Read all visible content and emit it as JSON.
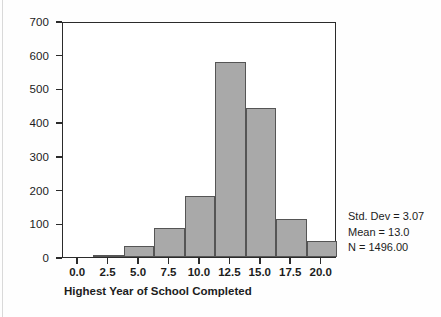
{
  "chart_data": {
    "type": "bar",
    "title": "",
    "subtitle": "",
    "xlabel": "Highest Year of School Completed",
    "ylabel": "",
    "xlim": [
      -1.25,
      21.25
    ],
    "ylim": [
      0,
      700
    ],
    "bin_width": 2.5,
    "grid": false,
    "legend": null,
    "bar_color": "#a9a9a9",
    "bar_edge_color": "#555555",
    "axis_color": "#2b2b2b",
    "xticks": [
      "0.0",
      "2.5",
      "5.0",
      "7.5",
      "10.0",
      "12.5",
      "15.0",
      "17.5",
      "20.0"
    ],
    "xtick_values": [
      0.0,
      2.5,
      5.0,
      7.5,
      10.0,
      12.5,
      15.0,
      17.5,
      20.0
    ],
    "yticks": [
      "0",
      "100",
      "200",
      "300",
      "400",
      "500",
      "600",
      "700"
    ],
    "ytick_values": [
      0,
      100,
      200,
      300,
      400,
      500,
      600,
      700
    ],
    "bins": [
      {
        "center": 0.0,
        "left": -1.25,
        "right": 1.25,
        "value": 0
      },
      {
        "center": 2.5,
        "left": 1.25,
        "right": 3.75,
        "value": 5
      },
      {
        "center": 5.0,
        "left": 3.75,
        "right": 6.25,
        "value": 33
      },
      {
        "center": 7.5,
        "left": 6.25,
        "right": 8.75,
        "value": 85
      },
      {
        "center": 10.0,
        "left": 8.75,
        "right": 11.25,
        "value": 180
      },
      {
        "center": 12.5,
        "left": 11.25,
        "right": 13.75,
        "value": 578
      },
      {
        "center": 15.0,
        "left": 13.75,
        "right": 16.25,
        "value": 443
      },
      {
        "center": 17.5,
        "left": 16.25,
        "right": 18.75,
        "value": 114
      },
      {
        "center": 20.0,
        "left": 18.75,
        "right": 21.25,
        "value": 48
      }
    ],
    "categories": [
      "0.0",
      "2.5",
      "5.0",
      "7.5",
      "10.0",
      "12.5",
      "15.0",
      "17.5",
      "20.0"
    ],
    "values": [
      0,
      5,
      33,
      85,
      180,
      578,
      443,
      114,
      48
    ],
    "annotations": {
      "std_dev": "Std. Dev = 3.07",
      "mean": "Mean = 13.0",
      "n": "N = 1496.00"
    }
  }
}
